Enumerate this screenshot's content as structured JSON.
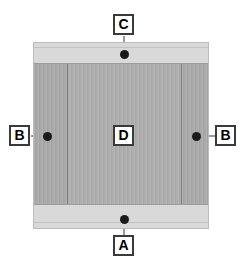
{
  "diagram": {
    "type": "callout-diagram",
    "canvas": {
      "width": 245,
      "height": 269,
      "background": "#ffffff"
    },
    "colors": {
      "band": "#d9d9d9",
      "core": "#a9a9a9",
      "core_inner": "#aeaeae",
      "divider": "#6f6f6f",
      "outline": "#bcbcbc",
      "marker": "#1a1a1a",
      "leader": "#9a9a9a",
      "label_border": "#3a3a3a",
      "label_fill": "#ffffff",
      "label_text": "#000000"
    },
    "figure": {
      "name": "cross-section-specimen",
      "x": 33,
      "y": 42,
      "width": 176,
      "height": 187,
      "top_band_height": 20,
      "bottom_band_height": 23
    },
    "callouts": [
      {
        "key": "C",
        "label": "C",
        "name": "callout-c",
        "position": "top",
        "label_x": 124,
        "label_y": 25,
        "dot_x": 124,
        "dot_y": 54,
        "leader": {
          "orientation": "vertical",
          "x": 124,
          "y1": 36,
          "y2": 54
        }
      },
      {
        "key": "B-left",
        "label": "B",
        "name": "callout-b-left",
        "position": "left",
        "label_x": 20,
        "label_y": 136,
        "dot_x": 47,
        "dot_y": 136,
        "leader": {
          "orientation": "horizontal",
          "y": 136,
          "x1": 31,
          "x2": 47
        }
      },
      {
        "key": "B-right",
        "label": "B",
        "name": "callout-b-right",
        "position": "right",
        "label_x": 226,
        "label_y": 136,
        "dot_x": 196,
        "dot_y": 136,
        "leader": {
          "orientation": "horizontal",
          "y": 136,
          "x1": 196,
          "x2": 215
        }
      },
      {
        "key": "D",
        "label": "D",
        "name": "callout-d",
        "position": "center",
        "label_x": 124,
        "label_y": 136,
        "dot_x": null,
        "dot_y": null,
        "leader": null
      },
      {
        "key": "A",
        "label": "A",
        "name": "callout-a",
        "position": "bottom",
        "label_x": 124,
        "label_y": 246,
        "dot_x": 124,
        "dot_y": 219,
        "leader": {
          "orientation": "vertical",
          "x": 124,
          "y1": 219,
          "y2": 235
        }
      }
    ]
  }
}
